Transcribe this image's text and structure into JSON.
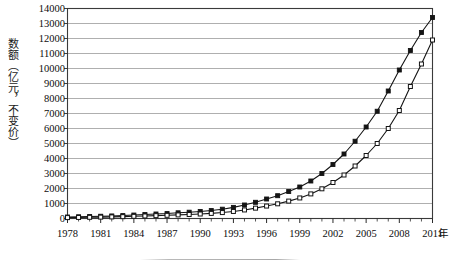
{
  "chart_data": {
    "type": "line",
    "title": "",
    "xlabel": "年",
    "ylabel": "数额（亿元，不变价）",
    "ylim": [
      0,
      14000
    ],
    "xlim": [
      1978,
      2011
    ],
    "grid": true,
    "legend_position": "none",
    "ytick_labels": [
      "0",
      "1000",
      "2000",
      "3000",
      "4000",
      "5000",
      "6000",
      "7000",
      "8000",
      "9000",
      "10000",
      "11000",
      "12000",
      "13000",
      "14000"
    ],
    "ytick_values": [
      0,
      1000,
      2000,
      3000,
      4000,
      5000,
      6000,
      7000,
      8000,
      9000,
      10000,
      11000,
      12000,
      13000,
      14000
    ],
    "xtick_labels": [
      "1978",
      "1981",
      "1984",
      "1987",
      "1990",
      "1993",
      "1996",
      "1999",
      "2002",
      "2005",
      "2008",
      "2011"
    ],
    "xtick_values": [
      1978,
      1981,
      1984,
      1987,
      1990,
      1993,
      1996,
      1999,
      2002,
      2005,
      2008,
      2011
    ],
    "x": [
      1978,
      1979,
      1980,
      1981,
      1982,
      1983,
      1984,
      1985,
      1986,
      1987,
      1988,
      1989,
      1990,
      1991,
      1992,
      1993,
      1994,
      1995,
      1996,
      1997,
      1998,
      1999,
      2000,
      2001,
      2002,
      2003,
      2004,
      2005,
      2006,
      2007,
      2008,
      2009,
      2010,
      2011
    ],
    "series": [
      {
        "name": "series-filled",
        "marker": "filled-square",
        "color": "#141414",
        "values": [
          100,
          115,
          130,
          150,
          170,
          195,
          230,
          265,
          300,
          330,
          380,
          420,
          470,
          530,
          620,
          740,
          900,
          1080,
          1300,
          1520,
          1800,
          2100,
          2500,
          3000,
          3600,
          4300,
          5150,
          6100,
          7150,
          8500,
          9900,
          11200,
          12400,
          13400
        ]
      },
      {
        "name": "series-open",
        "marker": "open-square",
        "color": "#141414",
        "values": [
          60,
          70,
          80,
          92,
          106,
          122,
          145,
          168,
          190,
          212,
          240,
          268,
          300,
          340,
          395,
          470,
          570,
          690,
          830,
          980,
          1160,
          1370,
          1640,
          1980,
          2400,
          2900,
          3500,
          4200,
          5000,
          6000,
          7200,
          8800,
          10300,
          11900
        ]
      }
    ]
  }
}
